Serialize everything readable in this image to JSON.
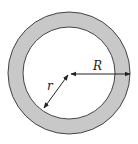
{
  "diagram": {
    "type": "annulus",
    "colors": {
      "ring_fill": "#c8c8c8",
      "inner_fill": "#ffffff",
      "stroke": "#333333"
    },
    "labels": {
      "outer_radius": "R",
      "inner_radius": "r"
    }
  }
}
